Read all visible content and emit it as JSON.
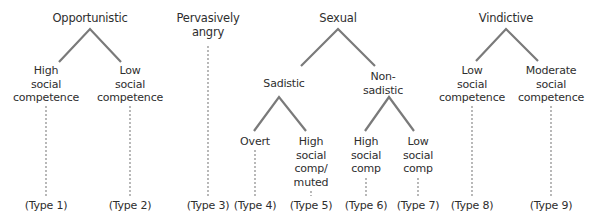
{
  "diagram": {
    "categories": [
      {
        "label": "Opportunistic",
        "children": [
          {
            "label": "High\nsocial\ncompetence",
            "type": "(Type 1)"
          },
          {
            "label": "Low\nsocial\ncompetence",
            "type": "(Type 2)"
          }
        ]
      },
      {
        "label": "Pervasively\nangry",
        "type": "(Type 3)"
      },
      {
        "label": "Sexual",
        "children": [
          {
            "label": "Sadistic",
            "children": [
              {
                "label": "Overt",
                "type": "(Type 4)"
              },
              {
                "label": "High\nsocial\ncomp/\nmuted",
                "type": "(Type 5)"
              }
            ]
          },
          {
            "label": "Non-\nsadistic",
            "children": [
              {
                "label": "High\nsocial\ncomp",
                "type": "(Type 6)"
              },
              {
                "label": "Low\nsocial\ncomp",
                "type": "(Type 7)"
              }
            ]
          }
        ]
      },
      {
        "label": "Vindictive",
        "children": [
          {
            "label": "Low\nsocial\ncompetence",
            "type": "(Type 8)"
          },
          {
            "label": "Moderate\nsocial\ncompetence",
            "type": "(Type 9)"
          }
        ]
      }
    ],
    "colors": {
      "branch": "#7a7a7a",
      "dotted": "#8a8a8a",
      "text": "#2e2e2e"
    }
  }
}
